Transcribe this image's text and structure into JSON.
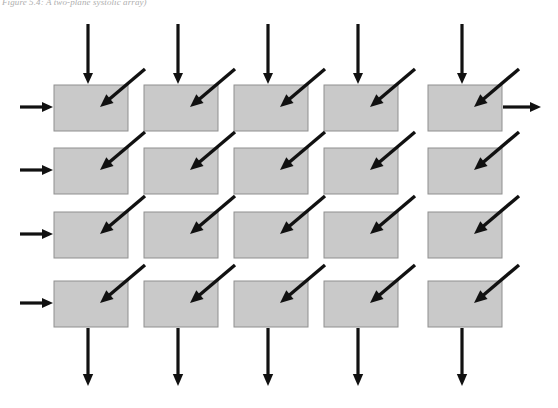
{
  "figure": {
    "caption": "Figure 5.4: A two-plane systolic array)",
    "title": "two-plane systolic array"
  },
  "canvas": {
    "width": 558,
    "height": 408,
    "background": "#ffffff"
  },
  "style": {
    "cell_fill": "#c9c9c9",
    "cell_stroke": "#8f8f8f",
    "arrow_color": "#111111",
    "caption_color": "#6b6b6b"
  },
  "grid": {
    "rows": 4,
    "cols": 5,
    "cell_width": 74,
    "cell_height": 46,
    "col_x": [
      54,
      144,
      234,
      324,
      428
    ],
    "row_y": [
      85,
      148,
      212,
      281
    ],
    "label": "systolic-cell"
  },
  "arrows": {
    "top_inputs": {
      "count": 5,
      "direction": "down",
      "label": "top-input-arrow",
      "x": [
        88,
        178,
        268,
        358,
        462
      ],
      "y_start": 24,
      "y_end": 84
    },
    "left_inputs": {
      "count": 4,
      "direction": "right",
      "label": "left-input-arrow",
      "y": [
        107,
        170,
        234,
        303
      ],
      "x_start": 20,
      "x_end": 53
    },
    "right_outputs": {
      "count": 1,
      "direction": "right",
      "label": "right-output-arrow",
      "y": [
        107
      ],
      "x_start": 503,
      "x_end": 541
    },
    "bottom_outputs": {
      "count": 5,
      "direction": "down",
      "label": "bottom-output-arrow",
      "x": [
        88,
        178,
        268,
        358,
        462
      ],
      "y_start": 328,
      "y_end": 386
    },
    "diagonal_inputs": {
      "count": 20,
      "direction": "down-left",
      "label": "diagonal-input-arrow",
      "dx": -45,
      "dy": 38,
      "tip_offset_x": 46,
      "tip_offset_y": 22
    }
  }
}
